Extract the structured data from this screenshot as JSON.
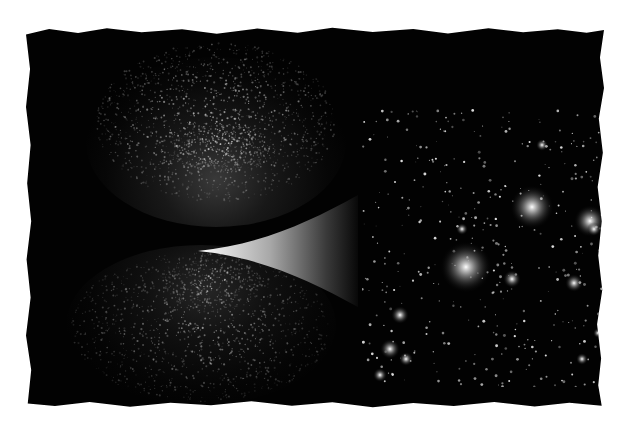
{
  "figure": {
    "panels": [
      {
        "name": "cosmic-web-top",
        "content": "filamentary large-scale structure"
      },
      {
        "name": "cosmic-web-bottom",
        "content": "filamentary large-scale structure"
      },
      {
        "name": "galaxy-cluster",
        "content": "zoomed view of galaxies in a cluster"
      }
    ],
    "colors": {
      "background": "#ffffff",
      "frame": "#020202",
      "filament": "#c8c8c8",
      "galaxy_glow": "#e6e6e6"
    }
  }
}
